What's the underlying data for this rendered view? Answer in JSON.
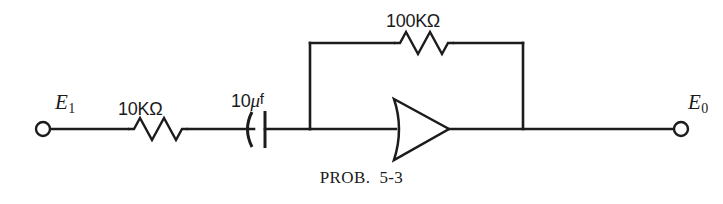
{
  "figure": {
    "caption_label": "PROB.",
    "caption_number": "5-3",
    "background_color": "#ffffff",
    "ink_color": "#1c1c1c"
  },
  "circuit": {
    "type": "inverting-operational-amplifier",
    "input_terminal": {
      "name": "input-terminal",
      "symbol": "E",
      "subscript": "1"
    },
    "output_terminal": {
      "name": "output-terminal",
      "symbol": "E",
      "subscript": "0"
    },
    "components": [
      {
        "id": "input-resistor",
        "kind": "resistor",
        "value": "10K",
        "unit": "Ω",
        "label": "10KΩ"
      },
      {
        "id": "coupling-capacitor",
        "kind": "capacitor",
        "value": "10",
        "unit": "μf",
        "label_value": "10",
        "label_mu": "μ",
        "label_suffix": "f"
      },
      {
        "id": "feedback-resistor",
        "kind": "resistor",
        "value": "100K",
        "unit": "Ω",
        "label": "100KΩ"
      },
      {
        "id": "amplifier",
        "kind": "amplifier-triangle",
        "label": ""
      }
    ]
  }
}
